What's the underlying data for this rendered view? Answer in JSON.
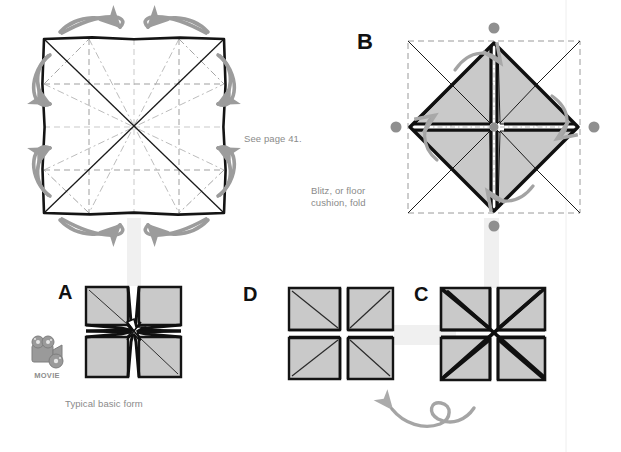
{
  "page": {
    "kind": "origami-instruction-diagram",
    "width": 621,
    "height": 452,
    "background": "#ffffff"
  },
  "colors": {
    "paper_fill": "#c9c9c9",
    "ink_black": "#111111",
    "crease_gray": "#9a9a9a",
    "arrow_gray": "#9c9c9c",
    "caption_gray": "#8a8a8a",
    "dot_gray": "#8f8f8f",
    "connector_band": "#f0f0f0"
  },
  "panels": [
    {
      "id": "crease-pattern",
      "letter": "",
      "caption": "See page 41.",
      "description": "Square sheet showing blintz crease pattern with mountain/valley lines and eight curved corner arrows"
    },
    {
      "id": "panel-b",
      "letter": "B",
      "caption": "Blitz, or floor\ncushion, fold",
      "description": "Diamond of folded corners inside dashed square, four gray reference dots"
    },
    {
      "id": "panel-a",
      "letter": "A",
      "caption": "Typical basic form",
      "description": "Finished blintzed square, four shaded quadrants with star center"
    },
    {
      "id": "panel-d",
      "letter": "D",
      "caption": "",
      "description": "Square with four shaded quadrants and cross gap"
    },
    {
      "id": "panel-c",
      "letter": "C",
      "caption": "",
      "description": "Square with heavy diagonal X and cross gap"
    }
  ],
  "labels": {
    "letter_b": "B",
    "letter_a": "A",
    "letter_d": "D",
    "letter_c": "C"
  },
  "captions": {
    "see_page": "See page 41.",
    "blitz": "Blitz, or floor\ncushion, fold",
    "typical_basic_form": "Typical basic form"
  },
  "badge": {
    "name": "movie-badge",
    "label": "MOVIE",
    "icon": "movie-camera-icon"
  },
  "annotations": {
    "turn_over_arrow": "turn-over-loop-arrow",
    "fold_arrows_count": 8,
    "reference_dots_count": 4
  }
}
